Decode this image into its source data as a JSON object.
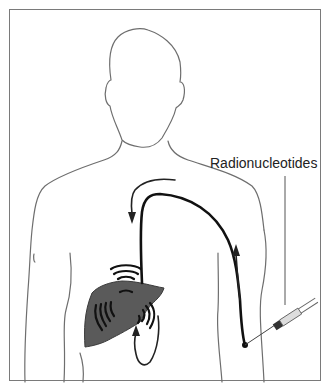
{
  "diagram": {
    "type": "medical-illustration",
    "labels": {
      "injection": "Radionucleotides"
    },
    "elements": [
      {
        "name": "body-outline",
        "description": "outline of head, neck, shoulders, torso and arms"
      },
      {
        "name": "liver",
        "description": "dark grey liver with emission arcs"
      },
      {
        "name": "circulation-path",
        "description": "thick black vessel line from injection site in right arm up and over to liver"
      },
      {
        "name": "flow-arrows",
        "description": "arrows indicating direction of flow"
      },
      {
        "name": "syringe",
        "description": "syringe injecting radionucleotides into arm"
      }
    ],
    "colors": {
      "outline": "#6e6e6e",
      "vessel": "#111111",
      "liver": "#5a5a5a",
      "frame": "#7a7a7a"
    }
  }
}
